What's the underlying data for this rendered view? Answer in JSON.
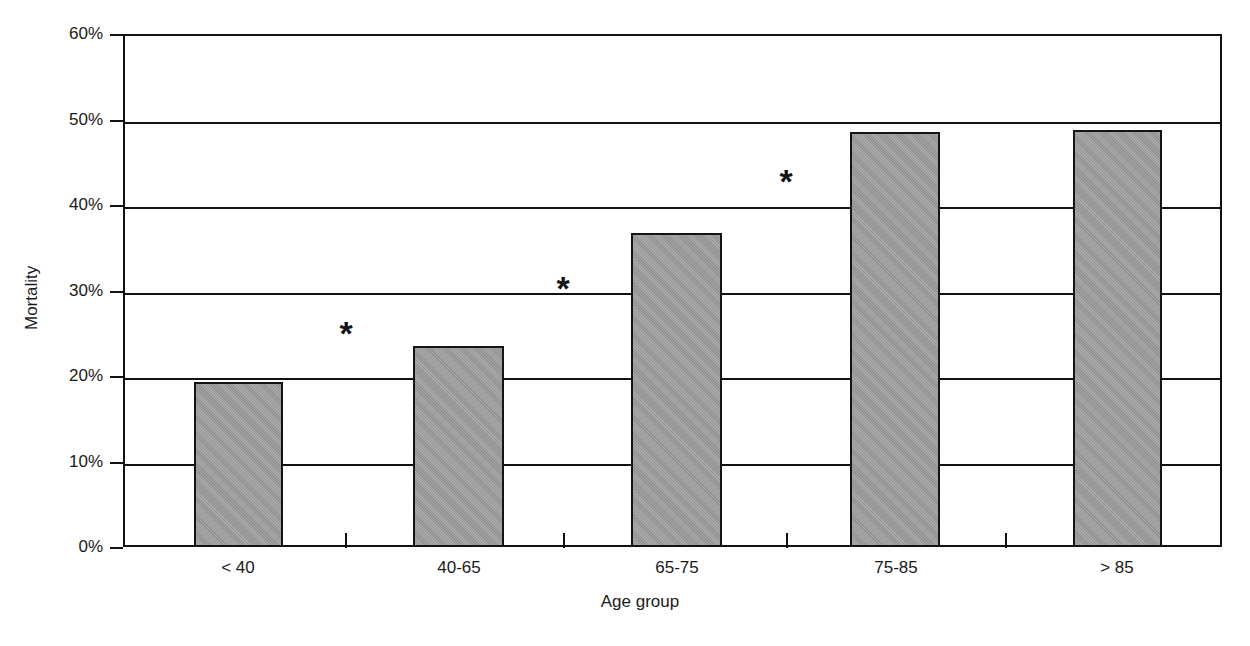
{
  "chart_data": {
    "type": "bar",
    "title": "",
    "xlabel": "Age group",
    "ylabel": "Mortality",
    "categories": [
      "< 40",
      "40-65",
      "65-75",
      "75-85",
      "> 85"
    ],
    "values": [
      19.3,
      23.5,
      36.7,
      48.6,
      48.8
    ],
    "value_labels": [
      "19.3%",
      "23.5%",
      "36.7%",
      "48.6%",
      "48.8%"
    ],
    "ylim": [
      0,
      60
    ],
    "ytick_labels": [
      "0%",
      "10%",
      "20%",
      "30%",
      "40%",
      "50%",
      "60%"
    ],
    "ytick_values": [
      0,
      10,
      20,
      30,
      40,
      50,
      60
    ],
    "grid": "horizontal",
    "legend": "none",
    "bar_color": "#9a9a9a",
    "bar_border_color": "#141414",
    "axis_color": "#111111",
    "annotations": [
      {
        "text": "*",
        "between": "< 40 / 40-65",
        "x_value": 1.5,
        "y_value": 25.0
      },
      {
        "text": "*",
        "between": "40-65 / 65-75",
        "x_value": 2.5,
        "y_value": 30.3
      },
      {
        "text": "*",
        "between": "65-75 / 75-85",
        "x_value": 3.5,
        "y_value": 42.8
      }
    ]
  },
  "figure": {
    "caption": "",
    "background": "#ffffff"
  }
}
